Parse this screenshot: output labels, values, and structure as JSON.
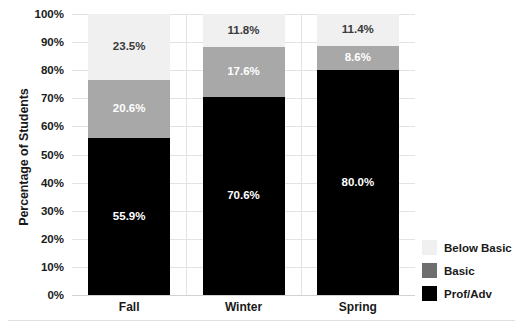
{
  "chart_data": {
    "type": "bar",
    "subtype": "stacked-vertical-100percent",
    "title": "",
    "xlabel": "",
    "ylabel": "Percentage of Students",
    "ylim": [
      0,
      100
    ],
    "ytick_labels": [
      "100%",
      "90%",
      "80%",
      "70%",
      "60%",
      "50%",
      "40%",
      "30%",
      "20%",
      "10%",
      "0%"
    ],
    "ytick_values": [
      100,
      90,
      80,
      70,
      60,
      50,
      40,
      30,
      20,
      10,
      0
    ],
    "grid": true,
    "legend_position": "right-bottom",
    "categories": [
      "Fall",
      "Winter",
      "Spring"
    ],
    "series": [
      {
        "name": "Prof/Adv",
        "color": "#000000",
        "legend_color": "#000000",
        "label_color": "#ffffff",
        "values": [
          55.9,
          70.6,
          80.0
        ],
        "labels": [
          "55.9%",
          "70.6%",
          "80.0%"
        ]
      },
      {
        "name": "Basic",
        "color": "#a8a8a8",
        "legend_color": "#6e6e6e",
        "label_color": "#ffffff",
        "values": [
          20.6,
          17.6,
          8.6
        ],
        "labels": [
          "20.6%",
          "17.6%",
          "8.6%"
        ]
      },
      {
        "name": "Below Basic",
        "color": "#f0f0f0",
        "legend_color": "#f0f0f0",
        "label_color": "#3a3a3a",
        "values": [
          23.5,
          11.8,
          11.4
        ],
        "labels": [
          "23.5%",
          "11.8%",
          "11.4%"
        ]
      }
    ]
  },
  "legend": {
    "items": [
      {
        "label": "Below Basic",
        "color": "#f0f0f0"
      },
      {
        "label": "Basic",
        "color": "#6e6e6e"
      },
      {
        "label": "Prof/Adv",
        "color": "#000000"
      }
    ]
  },
  "axis": {
    "y_title": "Percentage of Students"
  }
}
